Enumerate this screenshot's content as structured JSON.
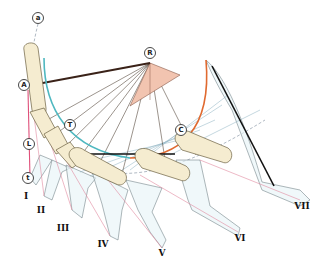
{
  "diagram": {
    "point_labels": [
      {
        "id": "a",
        "text": "a",
        "x": 38,
        "y": 18
      },
      {
        "id": "R",
        "text": "R",
        "x": 150,
        "y": 53
      },
      {
        "id": "A",
        "text": "A",
        "x": 24,
        "y": 85
      },
      {
        "id": "T",
        "text": "T",
        "x": 70,
        "y": 125
      },
      {
        "id": "C",
        "text": "C",
        "x": 181,
        "y": 130
      },
      {
        "id": "L",
        "text": "L",
        "x": 29,
        "y": 144
      },
      {
        "id": "t",
        "text": "t",
        "x": 28,
        "y": 178
      }
    ],
    "stage_labels": [
      {
        "text": "I",
        "x": 26,
        "y": 196
      },
      {
        "text": "II",
        "x": 41,
        "y": 210
      },
      {
        "text": "III",
        "x": 63,
        "y": 228
      },
      {
        "text": "IV",
        "x": 103,
        "y": 244
      },
      {
        "text": "V",
        "x": 162,
        "y": 253
      },
      {
        "text": "VI",
        "x": 240,
        "y": 238
      },
      {
        "text": "VII",
        "x": 302,
        "y": 206
      }
    ],
    "colors": {
      "outline_orange": "#e0a030",
      "arc_teal": "#4fb8c0",
      "arc_orange": "#e06a30",
      "triangle_fill": "#f2c4b0",
      "segment_fill": "#f5ecd0",
      "silhouette_fill": "#e8f4f8",
      "pink": "#e0507a"
    }
  }
}
